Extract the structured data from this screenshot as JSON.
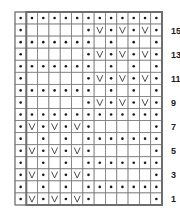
{
  "chart": {
    "title": "",
    "columns": 13,
    "legend": {
      "dot": "purl",
      "V": "slip stitch",
      "blank": "knit"
    },
    "row_labels": [
      "15",
      "13",
      "11",
      "9",
      "7",
      "5",
      "3",
      "1"
    ],
    "rows_top_to_bottom": [
      {
        "row": 16,
        "cells": [
          ".",
          ".",
          ".",
          ".",
          ".",
          ".",
          ".",
          ".",
          ".",
          ".",
          ".",
          ".",
          "."
        ]
      },
      {
        "row": 15,
        "cells": [
          ".",
          "",
          "",
          "",
          "",
          "",
          ".",
          "V",
          ".",
          "V",
          ".",
          "V",
          "."
        ]
      },
      {
        "row": 14,
        "cells": [
          ".",
          ".",
          ".",
          ".",
          ".",
          ".",
          ".",
          "",
          ".",
          "",
          ".",
          "",
          "."
        ]
      },
      {
        "row": 13,
        "cells": [
          ".",
          "",
          "",
          "",
          "",
          "",
          ".",
          "V",
          ".",
          "V",
          ".",
          "V",
          "."
        ]
      },
      {
        "row": 12,
        "cells": [
          ".",
          ".",
          ".",
          ".",
          ".",
          ".",
          ".",
          "",
          ".",
          "",
          ".",
          "",
          "."
        ]
      },
      {
        "row": 11,
        "cells": [
          ".",
          "",
          "",
          "",
          "",
          "",
          ".",
          "V",
          ".",
          "V",
          ".",
          "V",
          "."
        ]
      },
      {
        "row": 10,
        "cells": [
          ".",
          ".",
          ".",
          ".",
          ".",
          ".",
          ".",
          "",
          ".",
          "",
          ".",
          "",
          "."
        ]
      },
      {
        "row": 9,
        "cells": [
          ".",
          "",
          "",
          "",
          "",
          "",
          ".",
          "V",
          ".",
          "V",
          ".",
          "V",
          "."
        ]
      },
      {
        "row": 8,
        "cells": [
          ".",
          ".",
          ".",
          ".",
          ".",
          ".",
          ".",
          ".",
          ".",
          ".",
          ".",
          ".",
          "."
        ]
      },
      {
        "row": 7,
        "cells": [
          ".",
          "V",
          ".",
          "V",
          ".",
          "V",
          ".",
          "",
          "",
          "",
          "",
          "",
          "."
        ]
      },
      {
        "row": 6,
        "cells": [
          ".",
          "",
          ".",
          "",
          ".",
          "",
          ".",
          ".",
          ".",
          ".",
          ".",
          ".",
          "."
        ]
      },
      {
        "row": 5,
        "cells": [
          ".",
          "V",
          ".",
          "V",
          ".",
          "V",
          ".",
          "",
          "",
          "",
          "",
          "",
          "."
        ]
      },
      {
        "row": 4,
        "cells": [
          ".",
          "",
          ".",
          "",
          ".",
          "",
          ".",
          ".",
          ".",
          ".",
          ".",
          ".",
          "."
        ]
      },
      {
        "row": 3,
        "cells": [
          ".",
          "V",
          ".",
          "V",
          ".",
          "V",
          ".",
          "",
          "",
          "",
          "",
          "",
          "."
        ]
      },
      {
        "row": 2,
        "cells": [
          ".",
          "",
          ".",
          "",
          ".",
          "",
          ".",
          ".",
          ".",
          ".",
          ".",
          ".",
          "."
        ]
      },
      {
        "row": 1,
        "cells": [
          ".",
          "V",
          ".",
          "V",
          ".",
          "V",
          ".",
          "",
          "",
          "",
          "",
          "",
          "."
        ]
      }
    ],
    "colors": {
      "grid": "#7a7a7a",
      "frame": "#6e6e6e",
      "symbol": "#1a1a1a"
    }
  }
}
